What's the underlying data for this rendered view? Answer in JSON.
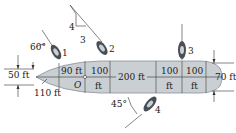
{
  "figure": {
    "colors": {
      "hull_fill": "#c9cfd3",
      "hull_stroke": "#8a9197",
      "line": "#333333",
      "tug_fill": "#4a4f55",
      "tug_light": "#c9cfd3"
    }
  },
  "labels": {
    "angle_tug1": "60°",
    "tug1": "1",
    "tug2": "2",
    "tug3": "3",
    "tug4": "4",
    "slope_rise": "4",
    "slope_run": "3",
    "dim_left_width": "50 ft",
    "dim_bow_length": "110 ft",
    "dim_90": "90 ft",
    "origin": "O",
    "dim_100a_top": "100",
    "dim_100a_bottom": "ft",
    "dim_200": "200 ft",
    "dim_100b_top": "100",
    "dim_100b_bottom": "ft",
    "dim_100c_top": "100",
    "dim_100c_bottom": "ft",
    "dim_right_width": "70 ft",
    "angle_tug4": "45°"
  }
}
